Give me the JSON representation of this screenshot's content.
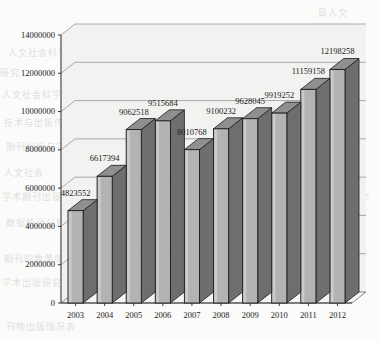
{
  "chart_data": {
    "type": "bar",
    "title": "",
    "subtitle": "",
    "xlabel": "",
    "ylabel": "",
    "categories": [
      "2003",
      "2004",
      "2005",
      "2006",
      "2007",
      "2008",
      "2009",
      "2010",
      "2011",
      "2012"
    ],
    "values": [
      4823552,
      6617394,
      9062518,
      9515684,
      8010768,
      9100232,
      9628045,
      9919252,
      11159158,
      12198258
    ],
    "data_labels": [
      "4823552",
      "6617394",
      "9062518",
      "9515684",
      "8010768",
      "9100232",
      "9628045",
      "9919252",
      "11159158",
      "12198258"
    ],
    "ylim": [
      0,
      14000000
    ],
    "ytick_labels": [
      "0",
      "2000000",
      "4000000",
      "6000000",
      "8000000",
      "10000000",
      "12000000",
      "14000000"
    ],
    "ytick_values": [
      0,
      2000000,
      4000000,
      6000000,
      8000000,
      10000000,
      12000000,
      14000000
    ],
    "grid": true,
    "grid_axis": "y",
    "legend": false,
    "legend_position": "none",
    "style": "3d",
    "bar_face_color": "#b3b3b3",
    "bar_side_color": "#6e6e6e",
    "bar_top_color": "#8f8f8f",
    "bar_outline_color": "#1c1c1c",
    "axis_color": "#555555",
    "grid_color": "#8a8a8a",
    "plot_background": "#f2f2f0",
    "annotations": []
  },
  "watermark": {
    "lines": [
      {
        "text": "目人文",
        "x": 318,
        "y": 6,
        "size": 9
      },
      {
        "text": "究与学术出版",
        "x": 270,
        "y": 28,
        "size": 9
      },
      {
        "text": "人文社会科学学术期刊的",
        "x": 8,
        "y": 46,
        "size": 9
      },
      {
        "text": "研究",
        "x": 0,
        "y": 66,
        "size": 9
      },
      {
        "text": "社会科学学",
        "x": 300,
        "y": 66,
        "size": 9
      },
      {
        "text": "人文社会科学",
        "x": 2,
        "y": 88,
        "size": 9
      },
      {
        "text": "学术期刊",
        "x": 310,
        "y": 90,
        "size": 9
      },
      {
        "text": "技术与出版传播研究的",
        "x": 4,
        "y": 116,
        "size": 9
      },
      {
        "text": "术",
        "x": 356,
        "y": 116,
        "size": 9
      },
      {
        "text": "期刊出版与学术研究",
        "x": 6,
        "y": 140,
        "size": 9
      },
      {
        "text": "人文社会",
        "x": 4,
        "y": 166,
        "size": 9
      },
      {
        "text": "学术期刊出版发展趋势",
        "x": 2,
        "y": 190,
        "size": 9
      },
      {
        "text": "学",
        "x": 360,
        "y": 192,
        "size": 9
      },
      {
        "text": "数据统计分析与研究",
        "x": 6,
        "y": 216,
        "size": 9
      },
      {
        "text": "期刊的数量增长",
        "x": 4,
        "y": 252,
        "size": 9
      },
      {
        "text": "学术出版研究统计",
        "x": 2,
        "y": 276,
        "size": 9
      },
      {
        "text": "刊物出版情况表",
        "x": 6,
        "y": 320,
        "size": 9
      }
    ]
  }
}
